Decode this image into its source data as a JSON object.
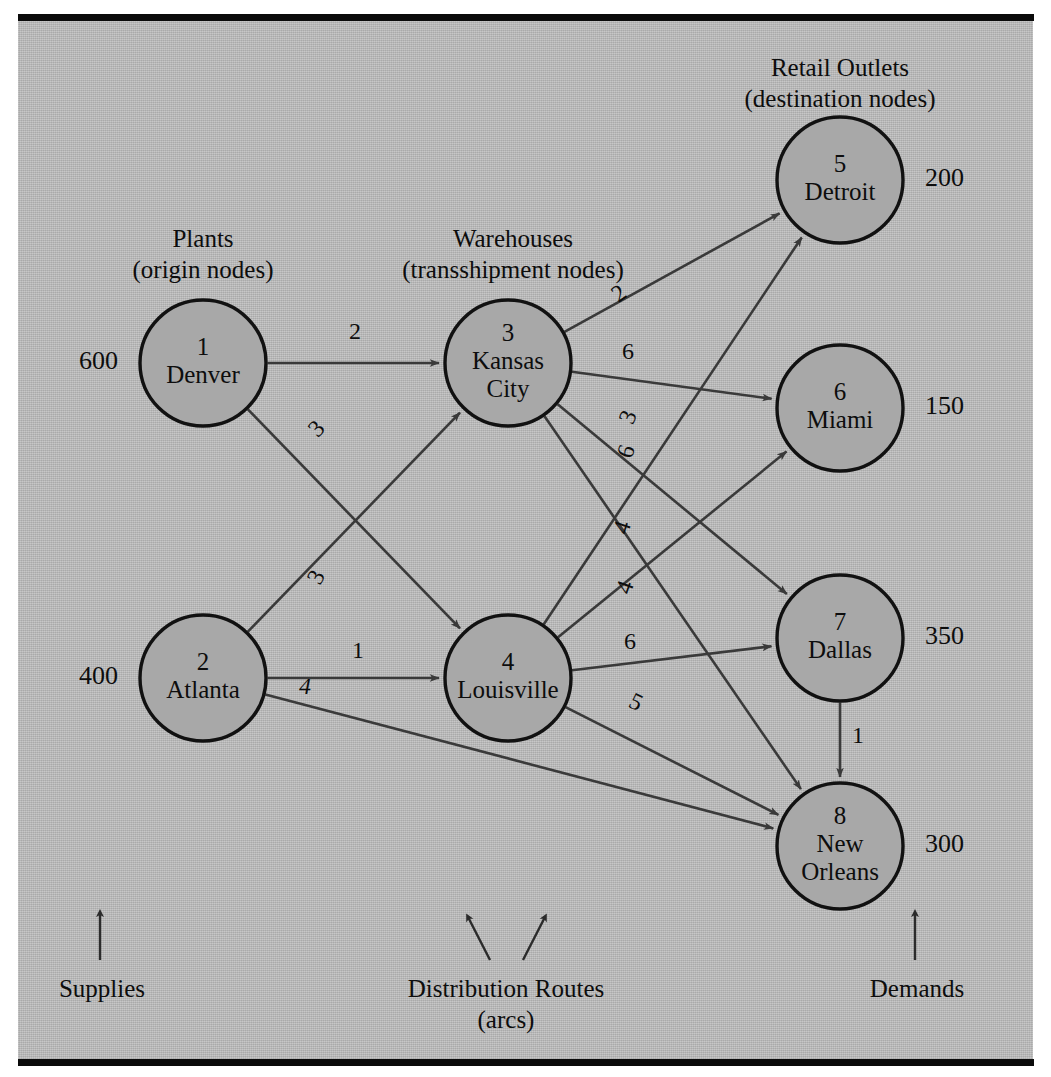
{
  "diagram": {
    "type": "network-flow",
    "headings": {
      "plants": "Plants",
      "plants_sub": "(origin nodes)",
      "warehouses": "Warehouses",
      "warehouses_sub": "(transshipment nodes)",
      "retail": "Retail Outlets",
      "retail_sub": "(destination nodes)"
    },
    "legend": {
      "supplies": "Supplies",
      "routes": "Distribution Routes",
      "routes_sub": "(arcs)",
      "demands": "Demands"
    },
    "nodes": [
      {
        "id": "1",
        "name": "Denver",
        "number": "1",
        "value": "600",
        "value_side": "left",
        "role": "origin",
        "cx": 203,
        "cy": 363,
        "r": 63
      },
      {
        "id": "2",
        "name": "Atlanta",
        "number": "2",
        "value": "400",
        "value_side": "left",
        "role": "origin",
        "cx": 203,
        "cy": 678,
        "r": 63
      },
      {
        "id": "3",
        "name": "Kansas City",
        "number": "3",
        "value": "",
        "value_side": "none",
        "role": "transshipment",
        "cx": 508,
        "cy": 363,
        "r": 63
      },
      {
        "id": "4",
        "name": "Louisville",
        "number": "4",
        "value": "",
        "value_side": "none",
        "role": "transshipment",
        "cx": 508,
        "cy": 678,
        "r": 63
      },
      {
        "id": "5",
        "name": "Detroit",
        "number": "5",
        "value": "200",
        "value_side": "right",
        "role": "destination",
        "cx": 840,
        "cy": 180,
        "r": 63
      },
      {
        "id": "6",
        "name": "Miami",
        "number": "6",
        "value": "150",
        "value_side": "right",
        "role": "destination",
        "cx": 840,
        "cy": 408,
        "r": 63
      },
      {
        "id": "7",
        "name": "Dallas",
        "number": "7",
        "value": "350",
        "value_side": "right",
        "role": "destination",
        "cx": 840,
        "cy": 638,
        "r": 63
      },
      {
        "id": "8",
        "name": "New Orleans",
        "number": "8",
        "value": "300",
        "value_side": "right",
        "role": "destination",
        "cx": 840,
        "cy": 846,
        "r": 63
      }
    ],
    "arcs": [
      {
        "from": "1",
        "to": "3",
        "cost": "2",
        "italic": false,
        "lx": 355,
        "ly": 333
      },
      {
        "from": "1",
        "to": "4",
        "cost": "3",
        "italic": false,
        "lx": 318,
        "ly": 430,
        "rot": -46
      },
      {
        "from": "2",
        "to": "3",
        "cost": "3",
        "italic": false,
        "lx": 318,
        "ly": 578,
        "rot": -62
      },
      {
        "from": "2",
        "to": "4",
        "cost": "1",
        "italic": false,
        "lx": 358,
        "ly": 652
      },
      {
        "from": "2",
        "to": "8",
        "cost": "4",
        "italic": true,
        "lx": 305,
        "ly": 688
      },
      {
        "from": "3",
        "to": "5",
        "cost": "2",
        "italic": false,
        "lx": 620,
        "ly": 295,
        "rot": -36
      },
      {
        "from": "3",
        "to": "6",
        "cost": "6",
        "italic": false,
        "lx": 628,
        "ly": 353
      },
      {
        "from": "3",
        "to": "7",
        "cost": "3",
        "italic": false,
        "lx": 630,
        "ly": 418,
        "rot": -68
      },
      {
        "from": "3",
        "to": "8",
        "cost": "6",
        "italic": false,
        "lx": 628,
        "ly": 452,
        "rot": -72
      },
      {
        "from": "4",
        "to": "5",
        "cost": "4",
        "italic": false,
        "lx": 624,
        "ly": 528,
        "rot": -72
      },
      {
        "from": "4",
        "to": "6",
        "cost": "4",
        "italic": false,
        "lx": 627,
        "ly": 588,
        "rot": -70
      },
      {
        "from": "4",
        "to": "7",
        "cost": "6",
        "italic": false,
        "lx": 630,
        "ly": 643
      },
      {
        "from": "4",
        "to": "8",
        "cost": "5",
        "italic": false,
        "lx": 635,
        "ly": 704,
        "rot": 26
      },
      {
        "from": "7",
        "to": "8",
        "cost": "1",
        "italic": false,
        "lx": 858,
        "ly": 737
      }
    ]
  }
}
